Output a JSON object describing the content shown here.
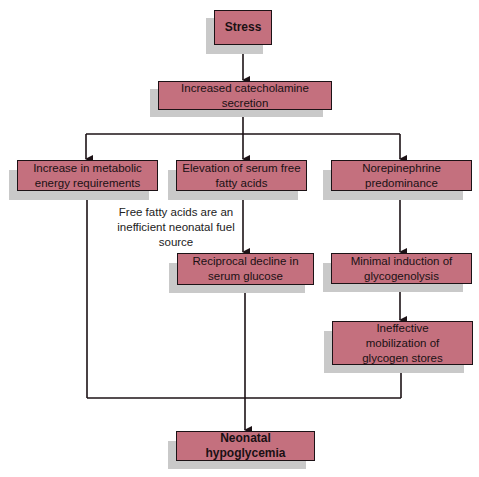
{
  "diagram": {
    "colors": {
      "box_fill": "#c4707e",
      "box_border": "#1c1216",
      "shadow": "#c9c9c9",
      "line": "#1c1216"
    },
    "nodes": {
      "stress": "Stress",
      "catecholamine": "Increased catecholamine secretion",
      "metabolic": "Increase in metabolic energy requirements",
      "ffa": "Elevation of serum free fatty acids",
      "norepinephrine": "Norepinephrine predominance",
      "glucose": "Reciprocal decline in serum glucose",
      "glycogenolysis": "Minimal induction of glycogenolysis",
      "mobilization": "Ineffective mobilization of glycogen stores",
      "hypoglycemia": "Neonatal hypoglycemia"
    },
    "note": "Free fatty acids are an inefficient neonatal fuel source"
  }
}
